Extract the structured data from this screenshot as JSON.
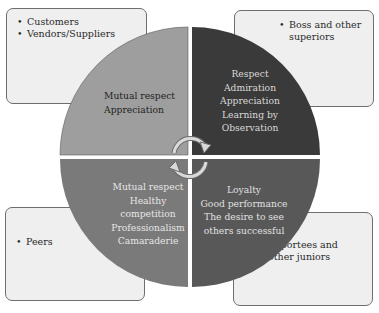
{
  "diagram": {
    "quadrants": [
      {
        "position": "top-left",
        "color": "#9e9e9e",
        "text_color": "#1f1f1f",
        "values": [
          "Mutual respect",
          "Appreciation"
        ],
        "group": [
          "Customers",
          "Vendors/Suppliers"
        ]
      },
      {
        "position": "top-right",
        "color": "#3a3a3a",
        "text_color": "#d8d8d8",
        "values": [
          "Respect",
          "Admiration",
          "Appreciation",
          "Learning by",
          "Observation"
        ],
        "group": [
          "Boss and other superiors"
        ]
      },
      {
        "position": "bottom-left",
        "color": "#7a7a7a",
        "text_color": "#e6e6e6",
        "values": [
          "Mutual respect",
          "Healthy",
          "competition",
          "Professionalism",
          "Camaraderie"
        ],
        "group": [
          "Peers"
        ]
      },
      {
        "position": "bottom-right",
        "color": "#585858",
        "text_color": "#e0e0e0",
        "values": [
          "Loyalty",
          "Good performance",
          "The desire to see",
          "others successful"
        ],
        "group": [
          "Reportees and other juniors"
        ]
      }
    ],
    "center_icon": "cycle-arrows-icon",
    "box_color": "#efefef",
    "box_border": "#6e6e6e"
  }
}
